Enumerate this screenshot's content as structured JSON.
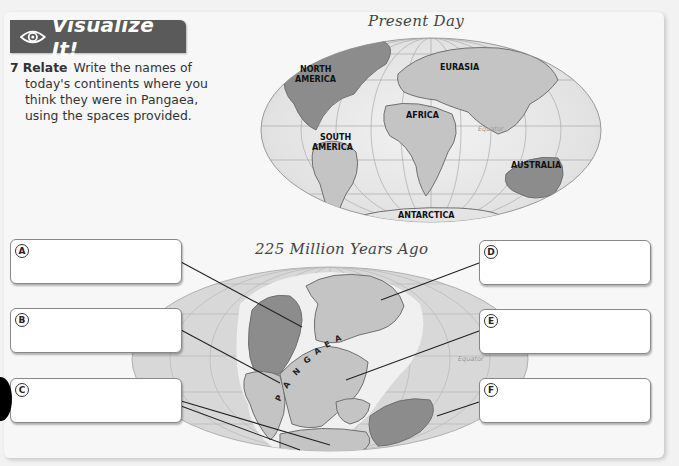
{
  "banner": {
    "icon": "eye-icon",
    "title": "Visualize It!"
  },
  "prompt": {
    "number": "7",
    "keyword": "Relate",
    "lines": [
      "Write the names of",
      "today's continents where you",
      "think they were in Pangaea,",
      "using the spaces provided."
    ]
  },
  "present_map": {
    "title": "Present Day",
    "labels": {
      "north_america_1": "NORTH",
      "north_america_2": "AMERICA",
      "eurasia": "EURASIA",
      "africa": "AFRICA",
      "south_america_1": "SOUTH",
      "south_america_2": "AMERICA",
      "australia": "AUSTRALIA",
      "antarctica": "ANTARCTICA",
      "equator": "Equator"
    }
  },
  "past_map": {
    "title": "225 Million Years Ago",
    "supercontinent_letters": [
      "P",
      "A",
      "N",
      "G",
      "A",
      "E",
      "A"
    ],
    "equator": "Equator"
  },
  "answer_boxes": [
    {
      "letter": "A",
      "value": "",
      "placeholder": ""
    },
    {
      "letter": "B",
      "value": "",
      "placeholder": ""
    },
    {
      "letter": "C",
      "value": "",
      "placeholder": ""
    },
    {
      "letter": "D",
      "value": "",
      "placeholder": ""
    },
    {
      "letter": "E",
      "value": "",
      "placeholder": ""
    },
    {
      "letter": "F",
      "value": "",
      "placeholder": ""
    }
  ],
  "colors": {
    "banner": "#5a5a5a",
    "land_light": "#c8c8c8",
    "land_dark": "#8c8c8c",
    "ocean": "#e6e6e6",
    "ocean_edge": "#d4d4d4"
  }
}
